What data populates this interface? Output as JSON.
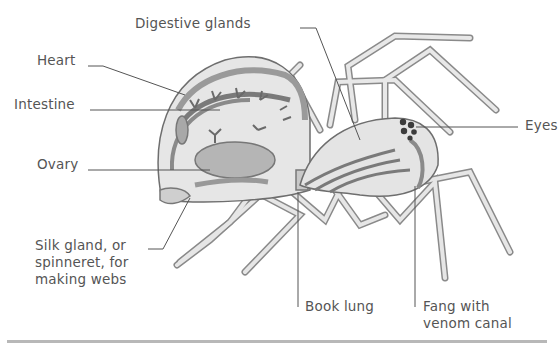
{
  "diagram": {
    "labels": {
      "digestive_glands": "Digestive glands",
      "heart": "Heart",
      "intestine": "Intestine",
      "ovary": "Ovary",
      "silk_gland": "Silk gland, or spinneret, for making webs",
      "book_lung": "Book lung",
      "fang": "Fang with venom canal",
      "eyes": "Eyes"
    },
    "colors": {
      "outline": "#6e6e6e",
      "body_fill": "#e6e6e6",
      "organ_dark": "#7a7a7a",
      "organ_mid": "#a8a8a8",
      "leader_line": "#555555",
      "rule": "#b8b8b8"
    }
  }
}
